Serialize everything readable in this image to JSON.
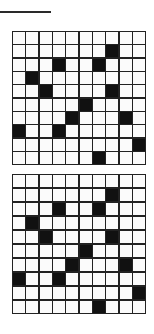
{
  "colors": {
    "filled": "#111111",
    "empty": "#fbfbfb",
    "lines": "#222222"
  },
  "grids": [
    {
      "rows": 10,
      "cols": 10,
      "filled": [
        [
          1,
          7
        ],
        [
          2,
          3
        ],
        [
          2,
          6
        ],
        [
          3,
          1
        ],
        [
          4,
          2
        ],
        [
          4,
          7
        ],
        [
          5,
          5
        ],
        [
          6,
          4
        ],
        [
          6,
          8
        ],
        [
          7,
          0
        ],
        [
          7,
          3
        ],
        [
          8,
          9
        ],
        [
          9,
          6
        ]
      ]
    },
    {
      "rows": 10,
      "cols": 10,
      "filled": [
        [
          1,
          7
        ],
        [
          2,
          3
        ],
        [
          2,
          6
        ],
        [
          3,
          1
        ],
        [
          4,
          2
        ],
        [
          4,
          7
        ],
        [
          5,
          5
        ],
        [
          6,
          4
        ],
        [
          6,
          8
        ],
        [
          7,
          0
        ],
        [
          7,
          3
        ],
        [
          8,
          9
        ],
        [
          9,
          6
        ]
      ]
    }
  ]
}
